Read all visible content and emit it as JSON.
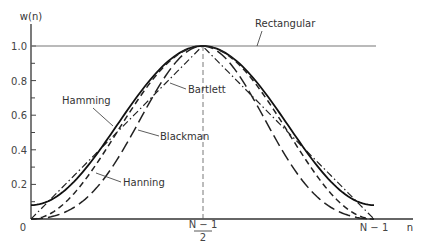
{
  "chart_data": {
    "type": "line",
    "title": "",
    "ylabel": "w(n)",
    "xlabel": "n",
    "ylim": [
      0,
      1.0
    ],
    "xlim": [
      "0",
      "N-1"
    ],
    "y_ticks": [
      "0",
      "0.2",
      "0.4",
      "0.6",
      "0.8",
      "1.0"
    ],
    "x_ticks": [
      {
        "label": "0",
        "pos": 0
      },
      {
        "label": "N-1 / 2",
        "numerator": "N − 1",
        "denominator": "2",
        "pos": 0.5
      },
      {
        "label": "N − 1",
        "pos": 1
      }
    ],
    "grid": false,
    "x": [
      0,
      0.1,
      0.2,
      0.3,
      0.4,
      0.5,
      0.6,
      0.7,
      0.8,
      0.9,
      1.0
    ],
    "series": [
      {
        "name": "Rectangular",
        "style": "solid-thin",
        "values": [
          1,
          1,
          1,
          1,
          1,
          1,
          1,
          1,
          1,
          1,
          1
        ]
      },
      {
        "name": "Bartlett",
        "style": "dash-dot",
        "values": [
          0,
          0.2,
          0.4,
          0.6,
          0.8,
          1.0,
          0.8,
          0.6,
          0.4,
          0.2,
          0
        ]
      },
      {
        "name": "Hamming",
        "style": "solid-thick",
        "values": [
          0.08,
          0.168,
          0.398,
          0.682,
          0.912,
          1.0,
          0.912,
          0.682,
          0.398,
          0.168,
          0.08
        ]
      },
      {
        "name": "Hanning",
        "style": "dashed",
        "values": [
          0,
          0.095,
          0.345,
          0.655,
          0.905,
          1.0,
          0.905,
          0.655,
          0.345,
          0.095,
          0
        ]
      },
      {
        "name": "Blackman",
        "style": "long-dash",
        "values": [
          0,
          0.04,
          0.201,
          0.509,
          0.849,
          1.0,
          0.849,
          0.509,
          0.201,
          0.04,
          0
        ]
      }
    ],
    "annotations": [
      {
        "text": "Rectangular",
        "target": "Rectangular"
      },
      {
        "text": "Bartlett",
        "target": "Bartlett"
      },
      {
        "text": "Hamming",
        "target": "Hamming"
      },
      {
        "text": "Blackman",
        "target": "Blackman"
      },
      {
        "text": "Hanning",
        "target": "Hanning"
      }
    ],
    "center_line": "dashed vertical at (N-1)/2"
  },
  "labels": {
    "ylabel": "w(n)",
    "xlabel": "n",
    "y_ticks": [
      "0.2",
      "0.4",
      "0.6",
      "0.8",
      "1.0"
    ],
    "origin": "0",
    "mid_num": "N − 1",
    "mid_den": "2",
    "end": "N − 1",
    "rectangular": "Rectangular",
    "bartlett": "Bartlett",
    "hamming": "Hamming",
    "blackman": "Blackman",
    "hanning": "Hanning"
  }
}
